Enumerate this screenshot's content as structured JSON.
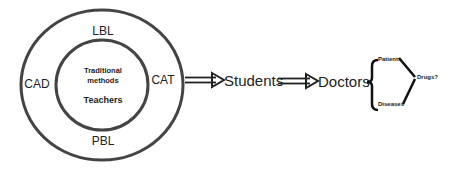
{
  "diagram": {
    "outer_ring": {
      "top": "LBL",
      "left": "CAD",
      "right": "CAT",
      "bottom": "PBL"
    },
    "inner_circle": {
      "line1": "Traditional",
      "line2": "methods",
      "line3": "Teachers"
    },
    "flow": {
      "step1": "Students",
      "step2": "Doctors"
    },
    "branches": {
      "upper": "Patients",
      "lower": "Diseases",
      "result": "Drugs?"
    },
    "colors": {
      "stroke": "#444444",
      "text": "#222222",
      "background": "#ffffff"
    }
  }
}
